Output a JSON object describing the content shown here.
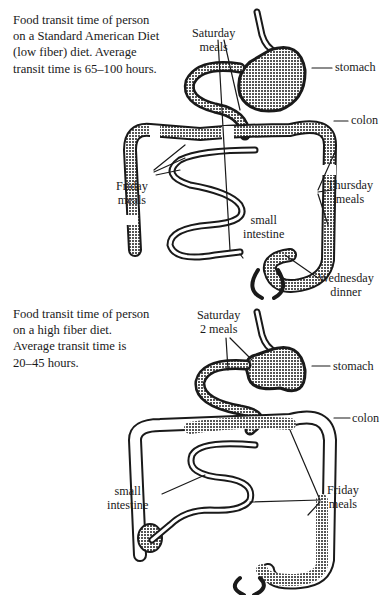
{
  "diagrams": [
    {
      "id": "standard-american-diet",
      "caption": "Food transit time of person\non a Standard American Diet\n(low fiber) diet. Average\ntransit time is 65–100 hours.",
      "average_transit_hours": "65–100",
      "labels": {
        "saturday": "Saturday\nmeals",
        "stomach": "stomach",
        "colon": "colon",
        "friday": "Friday\nmeals",
        "thursday": "Thursday\nmeals",
        "small_intestine": "small\nintestine",
        "wednesday": "Wednesday\ndinner"
      }
    },
    {
      "id": "high-fiber-diet",
      "caption": "Food transit time of person\non a high fiber diet.\nAverage transit time is\n20–45 hours.",
      "average_transit_hours": "20–45",
      "labels": {
        "saturday": "Saturday\n2 meals",
        "stomach": "stomach",
        "colon": "colon",
        "small_intestine": "small\nintestine",
        "friday": "Friday\nmeals"
      }
    }
  ],
  "colors": {
    "ink": "#1a1a1a",
    "fill_pattern": "#8a8a8a",
    "background": "#ffffff"
  }
}
